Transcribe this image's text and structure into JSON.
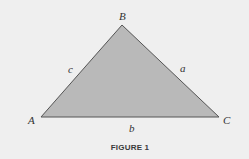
{
  "figure": {
    "caption": "FIGURE 1",
    "colors": {
      "background": "#efefef",
      "fill": "#b9b9b9",
      "stroke": "#555555",
      "text": "#333333"
    },
    "vertices": {
      "A": {
        "label": "A",
        "x": 41,
        "y": 117
      },
      "B": {
        "label": "B",
        "x": 122,
        "y": 25
      },
      "C": {
        "label": "C",
        "x": 219,
        "y": 117
      }
    },
    "sides": {
      "a": {
        "label": "a",
        "between": [
          "B",
          "C"
        ]
      },
      "b": {
        "label": "b",
        "between": [
          "A",
          "C"
        ]
      },
      "c": {
        "label": "c",
        "between": [
          "A",
          "B"
        ]
      }
    }
  }
}
